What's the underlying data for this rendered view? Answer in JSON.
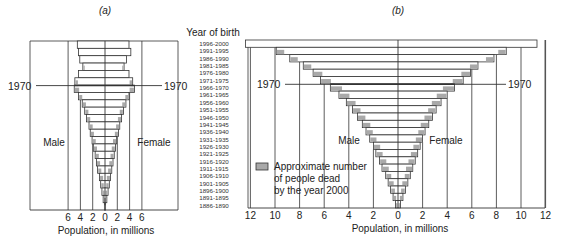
{
  "chart_data": [
    {
      "type": "bar",
      "subtype": "population-pyramid",
      "title": "(a)",
      "xlabel": "Population, in millions",
      "ylabel": "Year of birth",
      "xlim": [
        -6,
        6
      ],
      "x_ticks": [
        6,
        4,
        2,
        0,
        2,
        4,
        6
      ],
      "grid": true,
      "side_labels": {
        "left": "Male",
        "right": "Female"
      },
      "annotation": "1970",
      "annotation_row": "1966-1970",
      "categories": [
        "1996-2000",
        "1991-1995",
        "1986-1990",
        "1981-1985",
        "1976-1980",
        "1971-1975",
        "1966-1970",
        "1961-1965",
        "1956-1960",
        "1951-1955",
        "1946-1950",
        "1941-1945",
        "1936-1940",
        "1931-1935",
        "1926-1930",
        "1921-1925",
        "1916-1920",
        "1911-1915",
        "1906-1910",
        "1901-1905",
        "1896-1900",
        "1891-1895",
        "1886-1890"
      ],
      "series": [
        {
          "name": "Male",
          "values": [
            4.5,
            4.3,
            4.1,
            3.6,
            4.3,
            4.9,
            5.0,
            4.3,
            3.7,
            3.3,
            3.0,
            2.6,
            2.4,
            2.1,
            1.9,
            1.6,
            1.4,
            1.2,
            0.9,
            0.7,
            0.5,
            0.3,
            0.1
          ]
        },
        {
          "name": "Female",
          "values": [
            3.9,
            4.2,
            3.5,
            3.1,
            3.9,
            4.5,
            4.8,
            3.9,
            3.4,
            3.0,
            2.7,
            2.4,
            2.2,
            1.9,
            1.7,
            1.5,
            1.3,
            1.1,
            0.9,
            0.7,
            0.5,
            0.3,
            0.1
          ]
        },
        {
          "name": "Approximate number of people dead by the year 2000",
          "values": [
            0,
            0,
            0,
            0.2,
            0,
            0.4,
            0.7,
            0.5,
            0.5,
            0.5,
            0.5,
            0.5,
            0.5,
            0.5,
            0.5,
            0.5,
            0.5,
            0.5,
            0.5,
            0.4,
            0.3,
            0.2,
            0.1
          ]
        }
      ]
    },
    {
      "type": "bar",
      "subtype": "population-pyramid",
      "title": "(b)",
      "xlabel": "Population, in millions",
      "ylabel": "Year of birth",
      "xlim": [
        -12,
        12
      ],
      "x_ticks": [
        12,
        10,
        8,
        6,
        4,
        2,
        0,
        2,
        4,
        6,
        8,
        10,
        12
      ],
      "grid": true,
      "side_labels": {
        "left": "Male",
        "right": "Female"
      },
      "annotation": "1970",
      "annotation_row": "1966-1970",
      "categories": [
        "1996-2000",
        "1991-1995",
        "1986-1990",
        "1981-1985",
        "1976-1980",
        "1971-1975",
        "1966-1970",
        "1961-1965",
        "1956-1960",
        "1951-1955",
        "1946-1950",
        "1941-1945",
        "1936-1940",
        "1931-1935",
        "1926-1930",
        "1921-1925",
        "1916-1920",
        "1911-1915",
        "1906-1910",
        "1901-1905",
        "1896-1900",
        "1891-1895",
        "1886-1890"
      ],
      "series": [
        {
          "name": "Male",
          "values": [
            12.4,
            9.9,
            8.8,
            7.7,
            6.9,
            6.3,
            5.5,
            4.8,
            4.2,
            3.7,
            3.3,
            2.9,
            2.6,
            2.3,
            2.0,
            1.8,
            1.5,
            1.3,
            1.0,
            0.8,
            0.6,
            0.4,
            0.2
          ]
        },
        {
          "name": "Female",
          "values": [
            11.3,
            8.8,
            7.8,
            6.5,
            5.9,
            5.3,
            4.6,
            4.0,
            3.5,
            3.1,
            2.8,
            2.5,
            2.2,
            2.0,
            1.8,
            1.6,
            1.4,
            1.2,
            1.0,
            0.8,
            0.6,
            0.4,
            0.2
          ]
        },
        {
          "name": "Approximate number of people dead by the year 2000",
          "values": [
            0,
            0.6,
            0.6,
            0.6,
            0.7,
            0.8,
            0.9,
            0.8,
            0.7,
            0.6,
            0.6,
            0.6,
            0.5,
            0.5,
            0.5,
            0.5,
            0.5,
            0.5,
            0.4,
            0.4,
            0.3,
            0.2,
            0.1
          ]
        }
      ],
      "legend": {
        "position": "lower-left",
        "text": [
          "Approximate number",
          "of people dead",
          "by the year 2000"
        ],
        "swatch_color": "#a9a9a9"
      }
    }
  ],
  "labels": {
    "panel_a": "(a)",
    "panel_b": "(b)",
    "year_of_birth": "Year of birth",
    "axis_title": "Population, in millions",
    "male": "Male",
    "female": "Female",
    "marker_1970": "1970",
    "legend_lines": [
      "Approximate number",
      "of people dead",
      "by the year 2000"
    ]
  },
  "colors": {
    "line": "#333333",
    "bar_fill": "#ffffff",
    "dead_fill": "#a9a9a9"
  }
}
